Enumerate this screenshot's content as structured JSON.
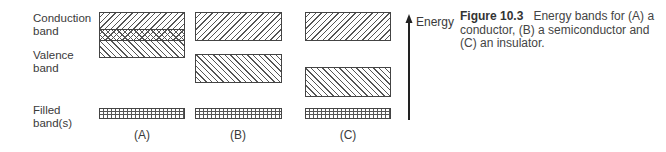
{
  "labels": {
    "conduction": [
      "Conduction",
      "band"
    ],
    "valence": [
      "Valence",
      "band"
    ],
    "filled": [
      "Filled",
      "band(s)"
    ]
  },
  "panels": [
    {
      "id": "A",
      "label": "(A)",
      "type": "conductor"
    },
    {
      "id": "B",
      "label": "(B)",
      "type": "semiconductor"
    },
    {
      "id": "C",
      "label": "(C)",
      "type": "insulator"
    }
  ],
  "axis": {
    "label": "Energy"
  },
  "caption": {
    "number": "Figure 10.3",
    "text": "Energy bands for (A) a conductor, (B) a semiconductor and (C) an insulator."
  }
}
